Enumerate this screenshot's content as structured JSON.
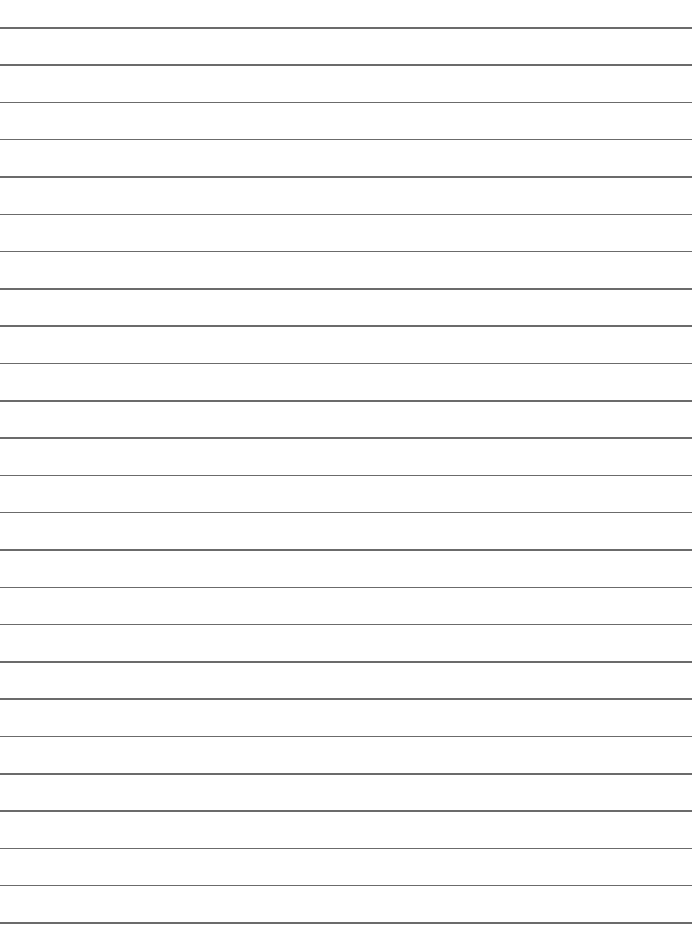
{
  "page": {
    "type": "lined-paper",
    "background_color": "#ffffff",
    "rule_color": "#6b6b6b",
    "rule_count": 25,
    "first_rule_y": 27,
    "rule_spacing": 37.3,
    "rule_width": 692
  }
}
